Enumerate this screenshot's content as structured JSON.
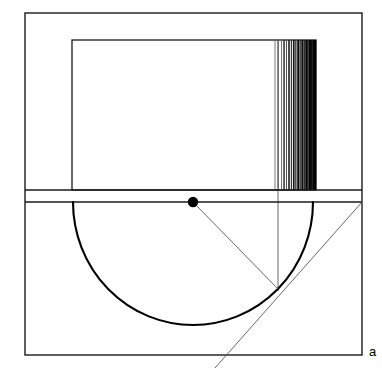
{
  "figure": {
    "caption_label": "a",
    "caption_x": 369,
    "caption_y": 345,
    "background_color": "#ffffff",
    "stroke_color": "#1a1a1a",
    "thin_stroke_color": "#555555",
    "accent_color": "#000000",
    "width": 382,
    "height": 375
  },
  "outer_frame": {
    "name": "outer-frame",
    "x1": 25,
    "y1": 13,
    "x2": 362,
    "y2": 355,
    "stroke_width": 1.4
  },
  "inner_rectangle": {
    "name": "inner-rectangle",
    "x1": 72,
    "y1": 40,
    "x2": 316,
    "y2": 190,
    "stroke_width": 1.3
  },
  "band": {
    "name": "horizontal-band",
    "top_line_y": 190,
    "bottom_line_y": 202,
    "x1": 25,
    "x2": 362,
    "stroke_width": 1.3
  },
  "center_point": {
    "name": "center-point",
    "x": 193,
    "y": 202,
    "radius": 5.2
  },
  "arc": {
    "name": "semicircle-arc",
    "center_x": 193,
    "center_y": 202,
    "radius_x": 120,
    "radius_y": 123,
    "start_x": 73,
    "start_y": 202,
    "end_x": 313,
    "end_y": 202,
    "stroke_width": 2.1
  },
  "vertical_line": {
    "name": "vertical-construction-line",
    "x": 278,
    "y1": 40,
    "y2": 291,
    "stroke_width": 0.9
  },
  "radius_line": {
    "name": "radius-line",
    "x1": 193,
    "y1": 202,
    "x2": 278,
    "y2": 289,
    "stroke_width": 0.9
  },
  "tangent_line": {
    "name": "tangent-line",
    "x1": 215,
    "y1": 368,
    "x2": 362,
    "y2": 202,
    "stroke_width": 0.9
  },
  "gradient_stripes": {
    "name": "gradient-stripe-band",
    "x_start": 274,
    "x_end": 316,
    "y_top": 40,
    "y_bottom": 190,
    "description": "vertical stripes increasing in density and darkness toward the right edge",
    "stripes": [
      {
        "x": 274.6,
        "w": 0.8,
        "color": "#555555"
      },
      {
        "x": 277.6,
        "w": 1.0,
        "color": "#4a4a4a"
      },
      {
        "x": 281.0,
        "w": 0.9,
        "color": "#6a6a6a"
      },
      {
        "x": 283.3,
        "w": 1.5,
        "color": "#2e2e2e"
      },
      {
        "x": 286.0,
        "w": 1.0,
        "color": "#555555"
      },
      {
        "x": 288.2,
        "w": 1.6,
        "color": "#1f1f1f"
      },
      {
        "x": 290.8,
        "w": 1.2,
        "color": "#3a3a3a"
      },
      {
        "x": 292.9,
        "w": 1.7,
        "color": "#161616"
      },
      {
        "x": 295.2,
        "w": 1.3,
        "color": "#2b2b2b"
      },
      {
        "x": 297.2,
        "w": 1.8,
        "color": "#101010"
      },
      {
        "x": 299.4,
        "w": 1.4,
        "color": "#242424"
      },
      {
        "x": 301.3,
        "w": 1.9,
        "color": "#0c0c0c"
      },
      {
        "x": 303.4,
        "w": 1.5,
        "color": "#1c1c1c"
      },
      {
        "x": 305.2,
        "w": 2.0,
        "color": "#080808"
      },
      {
        "x": 307.1,
        "w": 1.7,
        "color": "#141414"
      },
      {
        "x": 308.9,
        "w": 2.2,
        "color": "#050505"
      },
      {
        "x": 310.7,
        "w": 1.9,
        "color": "#0d0d0d"
      },
      {
        "x": 312.3,
        "w": 2.4,
        "color": "#020202"
      },
      {
        "x": 314.0,
        "w": 2.2,
        "color": "#000000"
      }
    ]
  }
}
